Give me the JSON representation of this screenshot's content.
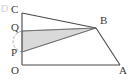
{
  "figure": {
    "type": "geometry-diagram",
    "canvas": {
      "width": 134,
      "height": 81,
      "background": "#ffffff"
    },
    "colors": {
      "stroke": "#4a4a4a",
      "fill_shaded": "#d9d9d9",
      "fill_shaded_stroke": "#8c8c8c",
      "label": "#3a3a3a",
      "faint_glyph": "#cfcfcf",
      "arc": "#9a9a9a"
    },
    "points": {
      "O": {
        "label": "O",
        "x": 22,
        "y": 65,
        "label_x": 11,
        "label_y": 67
      },
      "A": {
        "label": "A",
        "x": 120,
        "y": 65,
        "label_x": 119,
        "label_y": 67
      },
      "B": {
        "label": "B",
        "x": 96,
        "y": 28,
        "label_x": 99,
        "label_y": 18
      },
      "C": {
        "label": "C",
        "x": 22,
        "y": 13,
        "label_x": 11,
        "label_y": 4
      },
      "P": {
        "label": "P",
        "x": 22,
        "y": 52,
        "label_x": 11,
        "label_y": 50
      },
      "Q": {
        "label": "Q",
        "x": 22,
        "y": 31,
        "label_x": 11,
        "label_y": 22
      }
    },
    "segments": [
      {
        "name": "segment-OC",
        "from": "O",
        "to": "C"
      },
      {
        "name": "segment-OA",
        "from": "O",
        "to": "A"
      },
      {
        "name": "segment-CB",
        "from": "C",
        "to": "B"
      },
      {
        "name": "segment-QB",
        "from": "Q",
        "to": "B"
      },
      {
        "name": "segment-PB",
        "from": "P",
        "to": "B"
      },
      {
        "name": "segment-BA",
        "from": "B",
        "to": "A"
      }
    ],
    "shaded_region": {
      "name": "shaded-triangle-QBP",
      "vertices": [
        "Q",
        "B",
        "P"
      ],
      "fill": "#d9d9d9"
    },
    "angle_arc": {
      "name": "angle-arc-at-left",
      "center_x": 22,
      "center_y": 31,
      "radius": 21,
      "description": "arc from Q sweeping left down to P"
    },
    "edge_glyph": {
      "text": "D",
      "x": 1,
      "y": 5
    },
    "labels_order": [
      "C",
      "Q",
      "P",
      "O",
      "B",
      "A"
    ]
  }
}
